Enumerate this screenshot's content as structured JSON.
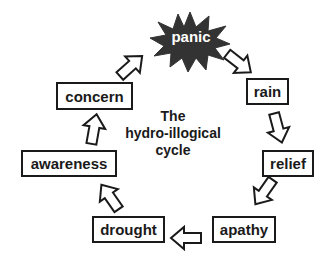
{
  "diagram": {
    "title_lines": [
      "The",
      "hydro-illogical",
      "cycle"
    ],
    "type": "cycle",
    "nodes": [
      {
        "id": "panic",
        "label": "panic",
        "shape": "starburst"
      },
      {
        "id": "rain",
        "label": "rain",
        "shape": "box"
      },
      {
        "id": "relief",
        "label": "relief",
        "shape": "box"
      },
      {
        "id": "apathy",
        "label": "apathy",
        "shape": "box"
      },
      {
        "id": "drought",
        "label": "drought",
        "shape": "box"
      },
      {
        "id": "awareness",
        "label": "awareness",
        "shape": "box"
      },
      {
        "id": "concern",
        "label": "concern",
        "shape": "box"
      }
    ],
    "edges": [
      {
        "from": "panic",
        "to": "rain"
      },
      {
        "from": "rain",
        "to": "relief"
      },
      {
        "from": "relief",
        "to": "apathy"
      },
      {
        "from": "apathy",
        "to": "drought"
      },
      {
        "from": "drought",
        "to": "awareness"
      },
      {
        "from": "awareness",
        "to": "concern"
      },
      {
        "from": "concern",
        "to": "panic"
      }
    ],
    "colors": {
      "starburst_fill": "#333333",
      "outline": "#1a1a1a",
      "background": "#ffffff"
    }
  }
}
